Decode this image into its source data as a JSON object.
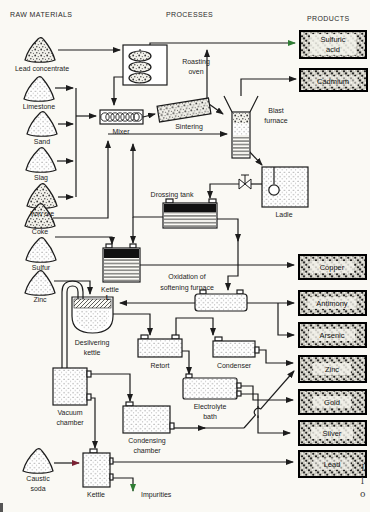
{
  "headers": {
    "raw_materials": "RAW MATERIALS",
    "processes": "PROCESSES",
    "products": "PRODUCTS"
  },
  "raw_materials": {
    "lead_concentrate": "Lead concentrate",
    "limestone": "Limestone",
    "sand": "Sand",
    "slag": "Slag",
    "iron_ore": "Iron ore",
    "coke": "Coke",
    "sulfur": "Sulfur",
    "zinc": "Zinc",
    "caustic_1": "Caustic",
    "caustic_2": "soda"
  },
  "processes": {
    "roasting_1": "Roasting",
    "roasting_2": "oven",
    "mixer": "Mixer",
    "sintering": "Sintering",
    "blast_1": "Blast",
    "blast_2": "furnace",
    "drossing_tank": "Drossing tank",
    "ladle": "Ladle",
    "kettle": "Kettle",
    "oxidation_1": "Oxidation of",
    "oxidation_2": "softening furnace",
    "l_marker": "L",
    "desilvering_1": "Desilvering",
    "desilvering_2": "kettle",
    "retort": "Retort",
    "condenser": "Condenser",
    "vacuum_1": "Vacuum",
    "vacuum_2": "chamber",
    "electrolyte_1": "Electrolyte",
    "electrolyte_2": "bath",
    "condensing_1": "Condensing",
    "condensing_2": "chamber",
    "kettle2": "Kettle",
    "impurities": "Impurities"
  },
  "products": {
    "sulfuric_1": "Sulfuric",
    "sulfuric_2": "acid",
    "cadmium": "Cadmium",
    "copper": "Copper",
    "antimony": "Antimony",
    "arsenic": "Arsenic",
    "zinc": "Zinc",
    "gold": "Gold",
    "silver": "Silver",
    "lead": "Lead"
  },
  "caption_fragments": {
    "f1": "I",
    "f2": "l",
    "f3": "o"
  },
  "colors": {
    "line": "#1c1c1c",
    "acid_line_green": "#2f7d33",
    "caustic_line_maroon": "#7b2233",
    "paper": "#faf9f4",
    "product_box_fill": "#c9c7bd"
  }
}
